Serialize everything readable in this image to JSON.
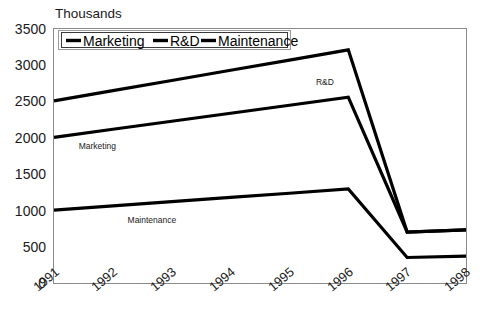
{
  "chart_data": {
    "type": "line",
    "title": "",
    "unit_label": "Thousands",
    "xlabel": "",
    "ylabel": "",
    "categories": [
      "1991",
      "1992",
      "1993",
      "1994",
      "1995",
      "1996",
      "1997",
      "1998"
    ],
    "ylim": [
      0,
      3500
    ],
    "ytick_step": 500,
    "yticks": [
      "3500",
      "3000",
      "2500",
      "2000",
      "1500",
      "1000",
      "500",
      "0"
    ],
    "grid": false,
    "legend_position": "top-left-inside",
    "series": [
      {
        "name": "Marketing",
        "color": "#000000",
        "values": [
          2000,
          2110,
          2220,
          2330,
          2440,
          2550,
          700,
          730
        ]
      },
      {
        "name": "R&D",
        "color": "#000000",
        "values": [
          2500,
          2640,
          2780,
          2920,
          3060,
          3200,
          700,
          730
        ]
      },
      {
        "name": "Maintenance",
        "color": "#000000",
        "values": [
          1000,
          1058,
          1116,
          1174,
          1232,
          1290,
          350,
          370
        ]
      }
    ],
    "annotations": [
      {
        "text": "R&D",
        "series": "R&D",
        "x_index": 4.45,
        "value": 2720
      },
      {
        "text": "Marketing",
        "series": "Marketing",
        "x_index": 0.42,
        "value": 1840
      },
      {
        "text": "Maintenance",
        "series": "Maintenance",
        "x_index": 1.25,
        "value": 830
      }
    ]
  },
  "legend": {
    "entries": [
      {
        "label": "Marketing"
      },
      {
        "label": "R&D"
      },
      {
        "label": "Maintenance"
      }
    ]
  }
}
